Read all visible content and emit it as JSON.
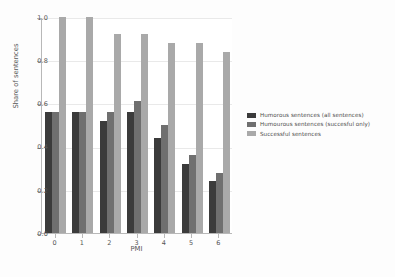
{
  "chart_data": {
    "type": "bar",
    "title": "",
    "xlabel": "PMI",
    "ylabel": "Share of sentences",
    "categories": [
      "0",
      "1",
      "2",
      "3",
      "4",
      "5",
      "6"
    ],
    "ylim": [
      0.0,
      1.0
    ],
    "yticks": [
      "0.0",
      "0.2",
      "0.4",
      "0.6",
      "0.8",
      "1.0"
    ],
    "ytick_values": [
      0.0,
      0.2,
      0.4,
      0.6,
      0.8,
      1.0
    ],
    "grid": true,
    "legend_position": "right",
    "series": [
      {
        "name": "Humorous sentences (all sentences)",
        "color": "#3b3b3b",
        "values": [
          0.56,
          0.56,
          0.52,
          0.56,
          0.44,
          0.32,
          0.24
        ]
      },
      {
        "name": "Humourous sentences (succesful only)",
        "color": "#6f6f6f",
        "values": [
          0.56,
          0.56,
          0.56,
          0.61,
          0.5,
          0.36,
          0.28
        ]
      },
      {
        "name": "Successful sentences",
        "color": "#a9a9a9",
        "values": [
          1.0,
          1.0,
          0.92,
          0.92,
          0.88,
          0.88,
          0.84
        ]
      }
    ]
  },
  "colors": {
    "figure_background": "#fdfdfd",
    "axes_background": "#ffffff",
    "axis_line": "#b8b8b8",
    "gridline": "#e9e9e9",
    "text": "#555555"
  }
}
